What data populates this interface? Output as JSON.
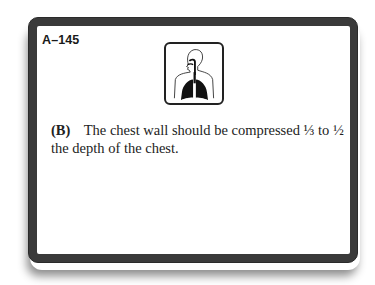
{
  "card": {
    "id": "A–145",
    "icon": "respiratory-system-icon",
    "answer_choice": "(B)",
    "answer_text": "The chest wall should be compressed ⅓ to ½ the depth of the chest."
  },
  "colors": {
    "frame": "#3a3a3a",
    "face": "#ffffff",
    "text": "#222222"
  }
}
